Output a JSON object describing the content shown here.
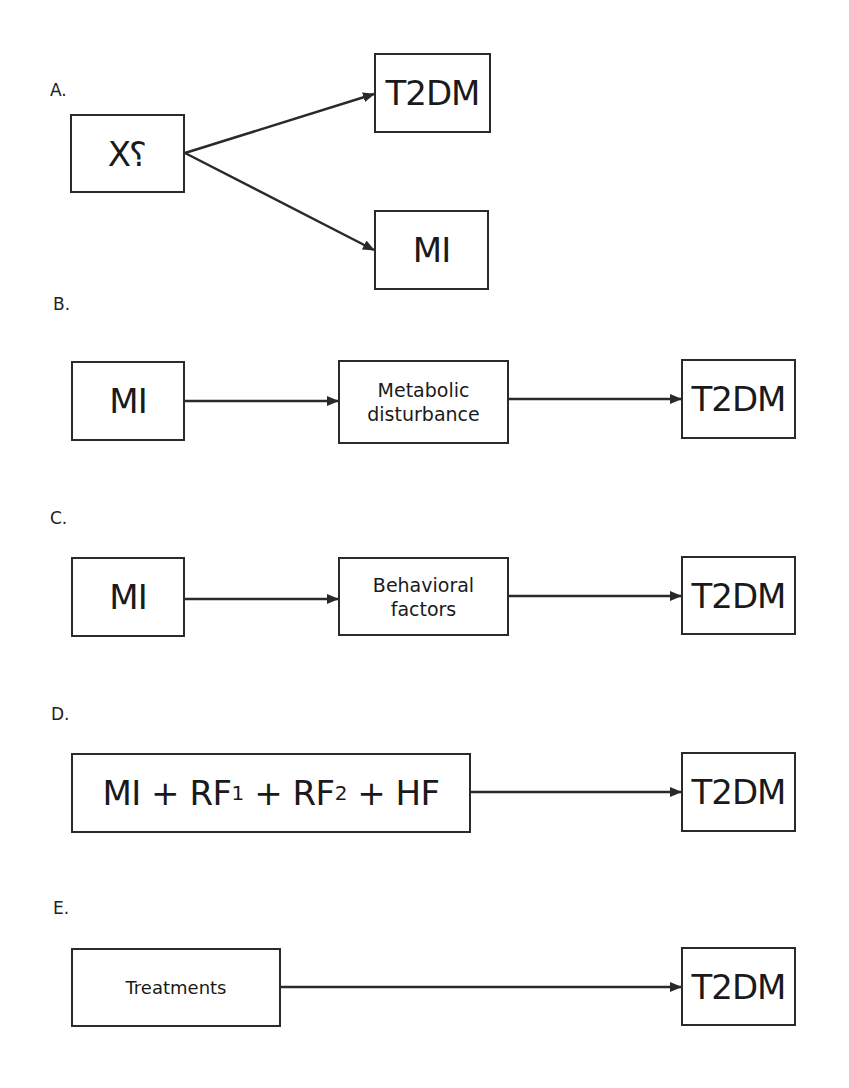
{
  "panels": {
    "A": {
      "label": "A.",
      "source": {
        "text_main": "X",
        "text_mark": "?"
      },
      "targets": [
        {
          "text": "T2DM"
        },
        {
          "text": "MI"
        }
      ]
    },
    "B": {
      "label": "B.",
      "nodes": [
        {
          "text": "MI"
        },
        {
          "line1": "Metabolic",
          "line2": "disturbance"
        },
        {
          "text": "T2DM"
        }
      ]
    },
    "C": {
      "label": "C.",
      "nodes": [
        {
          "text": "MI"
        },
        {
          "line1": "Behavioral",
          "line2": "factors"
        },
        {
          "text": "T2DM"
        }
      ]
    },
    "D": {
      "label": "D.",
      "source": {
        "mi": "MI",
        "plus": "+",
        "rf": "RF",
        "sub1": "1",
        "sub2": "2",
        "hf": "HF"
      },
      "target": {
        "text": "T2DM"
      }
    },
    "E": {
      "label": "E.",
      "source": {
        "text": "Treatments"
      },
      "target": {
        "text": "T2DM"
      }
    }
  },
  "colors": {
    "stroke": "#2a2a2a",
    "background": "#ffffff"
  }
}
